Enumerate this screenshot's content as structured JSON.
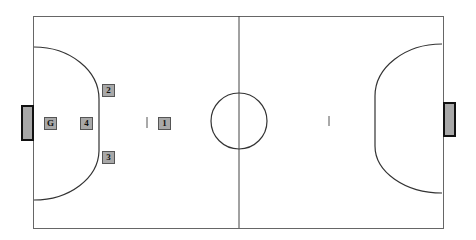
{
  "diagram": {
    "type": "futsal-court",
    "court": {
      "x": 33,
      "y": 16,
      "width": 410,
      "height": 212,
      "line_color": "#555555",
      "background": "#ffffff"
    },
    "center_line_x": 239,
    "center_circle": {
      "cx": 239,
      "cy": 121,
      "r": 28
    },
    "left_goal": {
      "x": 21,
      "y": 105,
      "width": 12,
      "height": 35,
      "fill": "#a8a8a8"
    },
    "right_goal": {
      "x": 443,
      "y": 102,
      "width": 13,
      "height": 34,
      "fill": "#a8a8a8"
    },
    "penalty_marks": [
      {
        "side": "left",
        "x": 147,
        "y": 117
      },
      {
        "side": "right",
        "x": 329,
        "y": 116
      }
    ],
    "players": [
      {
        "label": "G",
        "x": 44,
        "y": 117
      },
      {
        "label": "4",
        "x": 80,
        "y": 117
      },
      {
        "label": "2",
        "x": 102,
        "y": 84
      },
      {
        "label": "3",
        "x": 102,
        "y": 151
      },
      {
        "label": "1",
        "x": 158,
        "y": 117
      }
    ]
  }
}
